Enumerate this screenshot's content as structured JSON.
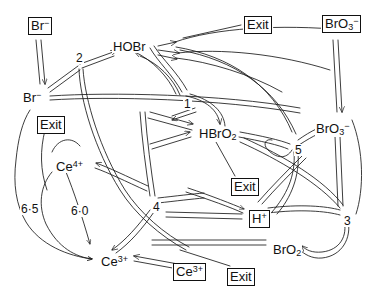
{
  "diagram": {
    "type": "reaction-network",
    "stroke_color": "#1a1a1a",
    "background_color": "#ffffff",
    "species": [
      {
        "id": "br-pool",
        "label_html": "Br<sup>-</sup>",
        "label_text": "Br-",
        "boxed": true,
        "x": 27,
        "y": 19
      },
      {
        "id": "hobr",
        "label_html": "HOBr",
        "label_text": "HOBr",
        "boxed": false,
        "x": 112,
        "y": 40
      },
      {
        "id": "exit-top",
        "label_html": "Exit",
        "label_text": "Exit",
        "boxed": true,
        "x": 243,
        "y": 18
      },
      {
        "id": "bro3-pool",
        "label_html": "BrO<sub>3</sub><sup>-</sup>",
        "label_text": "BrO3-",
        "boxed": true,
        "x": 321,
        "y": 17
      },
      {
        "id": "br",
        "label_html": "Br<sup>-</sup>",
        "label_text": "Br-",
        "boxed": false,
        "x": 22,
        "y": 91
      },
      {
        "id": "exit-left",
        "label_html": "Exit",
        "label_text": "Exit",
        "boxed": true,
        "x": 36,
        "y": 118
      },
      {
        "id": "hbro2",
        "label_html": "HBrO<sub>2</sub>",
        "label_text": "HBrO2",
        "boxed": false,
        "x": 198,
        "y": 127
      },
      {
        "id": "bro3",
        "label_html": "BrO<sub>3</sub><sup>-</sup>",
        "label_text": "BrO3-",
        "boxed": false,
        "x": 315,
        "y": 122
      },
      {
        "id": "ce4",
        "label_html": "Ce<sup>4+</sup>",
        "label_text": "Ce4+",
        "boxed": false,
        "x": 55,
        "y": 160
      },
      {
        "id": "exit-mid",
        "label_html": "Exit",
        "label_text": "Exit",
        "boxed": true,
        "x": 230,
        "y": 180
      },
      {
        "id": "hplus",
        "label_html": "H<sup>+</sup>",
        "label_text": "H+",
        "boxed": true,
        "x": 248,
        "y": 212
      },
      {
        "id": "bro2",
        "label_html": "BrO<sub>2</sub>",
        "label_text": "BrO2",
        "boxed": false,
        "x": 272,
        "y": 243
      },
      {
        "id": "ce3",
        "label_html": "Ce<sup>3+</sup>",
        "label_text": "Ce3+",
        "boxed": false,
        "x": 100,
        "y": 255
      },
      {
        "id": "ce3-pool",
        "label_html": "Ce<sup>3+</sup>",
        "label_text": "Ce3+",
        "boxed": true,
        "x": 172,
        "y": 265
      },
      {
        "id": "exit-bot",
        "label_html": "Exit",
        "label_text": "Exit",
        "boxed": true,
        "x": 226,
        "y": 270
      }
    ],
    "reaction_nodes": [
      {
        "id": "node-2",
        "label": "2",
        "x": 75,
        "y": 52
      },
      {
        "id": "node-1",
        "label": "1",
        "x": 183,
        "y": 98
      },
      {
        "id": "node-5",
        "label": "5",
        "x": 294,
        "y": 144
      },
      {
        "id": "node-4",
        "label": "4",
        "x": 152,
        "y": 201
      },
      {
        "id": "node-3",
        "label": "3",
        "x": 343,
        "y": 215
      }
    ],
    "rate_labels": [
      {
        "id": "rate-65",
        "label": "6·5",
        "x": 20,
        "y": 203
      },
      {
        "id": "rate-60",
        "label": "6·0",
        "x": 70,
        "y": 205
      }
    ]
  }
}
